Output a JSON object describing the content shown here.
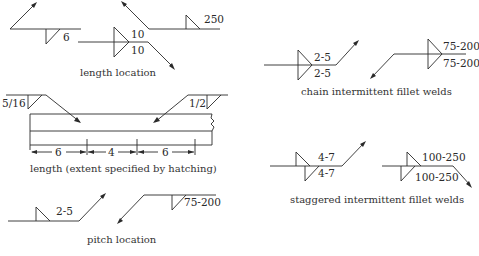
{
  "captions": {
    "length_location": "length location",
    "length_extent": "length (extent specified by hatching)",
    "pitch_location": "pitch location",
    "chain": "chain intermittent fillet welds",
    "staggered": "staggered intermittent fillet welds"
  },
  "length_location": {
    "symbol_a_value": "6",
    "symbol_b_top": "10",
    "symbol_b_bottom": "10",
    "symbol_c_value": "250"
  },
  "length_extent": {
    "left_size": "5/16",
    "right_size": "1/2",
    "dimensions": [
      "6",
      "4",
      "6"
    ]
  },
  "pitch_location": {
    "symbol_a_value": "2-5",
    "symbol_b_value": "75-200"
  },
  "chain": {
    "symbol_a_top": "2-5",
    "symbol_a_bottom": "2-5",
    "symbol_b_top": "75-200",
    "symbol_b_bottom": "75-200"
  },
  "staggered": {
    "symbol_a_top": "4-7",
    "symbol_a_bottom": "4-7",
    "symbol_b_top": "100-250",
    "symbol_b_bottom": "100-250"
  },
  "colors": {
    "ink": "#2a2a2a",
    "background": "#ffffff"
  }
}
